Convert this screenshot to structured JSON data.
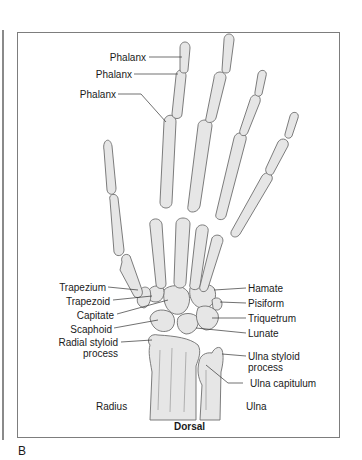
{
  "figure": {
    "panel_letter": "B",
    "view_caption": "Dorsal",
    "colors": {
      "bone_fill": "#e6e6e6",
      "bone_stroke": "#6e6e6e",
      "frame": "#7d7d7d",
      "text": "#1a1a1a"
    }
  },
  "labels": {
    "left": [
      {
        "text": "Phalanx",
        "target": "index distal phalanx"
      },
      {
        "text": "Phalanx",
        "target": "index middle phalanx"
      },
      {
        "text": "Phalanx",
        "target": "index proximal phalanx"
      },
      {
        "text": "Trapezium"
      },
      {
        "text": "Trapezoid"
      },
      {
        "text": "Capitate"
      },
      {
        "text": "Scaphoid"
      },
      {
        "text": "Radial styloid",
        "line2": "process"
      }
    ],
    "right": [
      {
        "text": "Hamate"
      },
      {
        "text": "Pisiform"
      },
      {
        "text": "Triquetrum"
      },
      {
        "text": "Lunate"
      },
      {
        "text": "Ulna styloid",
        "line2": "process"
      },
      {
        "text": "Ulna capitulum"
      }
    ],
    "bones": {
      "radius": "Radius",
      "ulna": "Ulna"
    }
  }
}
